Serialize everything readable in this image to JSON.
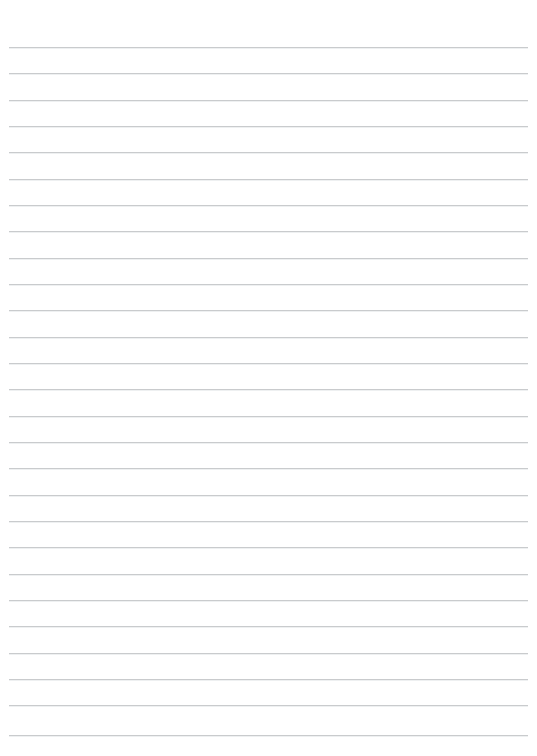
{
  "page": {
    "kind": "lined-paper-template",
    "width": 537,
    "height": 756,
    "background_color": "#ffffff",
    "title": ""
  },
  "watermark": {
    "name": "compass-rose-emblem",
    "description": "faint partial circular emblem with radiating petal lines, clipped by the top edge of the page",
    "color": "#e8eaec",
    "center_x": 268,
    "center_y": -40,
    "radius": 80,
    "visible_height": 15,
    "left_extent": 190,
    "right_extent": 346
  },
  "ruling": {
    "line_color": "#c9cbcd",
    "line_thickness": 1,
    "line_spacing": 26.3,
    "first_line_y": 47,
    "margin_left": 9,
    "margin_right": 9,
    "line_count": 27,
    "line_y_positions": [
      47,
      73,
      100,
      126,
      152,
      179,
      205,
      231,
      258,
      284,
      310,
      337,
      363,
      389,
      416,
      442,
      468,
      495,
      521,
      547,
      574,
      600,
      626,
      653,
      679,
      705,
      735
    ]
  }
}
